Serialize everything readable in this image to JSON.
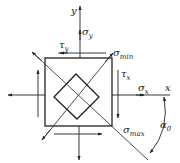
{
  "diagram": {
    "type": "plane-stress-element",
    "colors": {
      "stroke": "#222222",
      "background": "#ffffff"
    },
    "axes": {
      "x_label": "x",
      "y_label": "y"
    },
    "stresses": {
      "sigma_y": {
        "symbol": "σ",
        "sub": "y"
      },
      "sigma_x": {
        "symbol": "σ",
        "sub": "x"
      },
      "tau_y": {
        "symbol": "τ",
        "sub": "y"
      },
      "tau_x": {
        "symbol": "τ",
        "sub": "x"
      },
      "sigma_min": {
        "symbol": "σ",
        "sub": "min"
      },
      "sigma_max": {
        "symbol": "σ",
        "sub": "max"
      }
    },
    "angle": {
      "symbol": "α",
      "sub": "0"
    }
  }
}
